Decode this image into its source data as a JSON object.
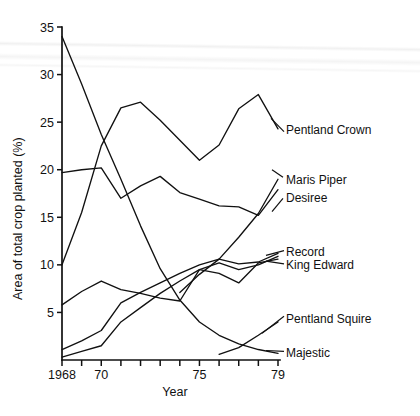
{
  "chart_data": {
    "type": "line",
    "title": "",
    "xlabel": "Year",
    "ylabel": "Area of total crop planted (%)",
    "x": [
      1968,
      1969,
      1970,
      1971,
      1972,
      1973,
      1974,
      1975,
      1976,
      1977,
      1978,
      1979
    ],
    "xlim": [
      1968,
      1979
    ],
    "ylim": [
      0,
      35
    ],
    "yticks": [
      5,
      10,
      15,
      20,
      25,
      30,
      35
    ],
    "xticks": [
      1968,
      1969,
      1970,
      1971,
      1972,
      1973,
      1974,
      1975,
      1976,
      1977,
      1978,
      1979
    ],
    "xtick_labels": [
      "1968",
      "",
      "70",
      "",
      "",
      "",
      "",
      "75",
      "",
      "",
      "",
      "79"
    ],
    "grid": false,
    "legend_position": "right-inline-labels",
    "series": [
      {
        "name": "Pentland Crown",
        "values": [
          10.0,
          15.5,
          22.5,
          26.5,
          27.1,
          25.2,
          23.1,
          21.0,
          22.6,
          26.4,
          27.9,
          24.3
        ]
      },
      {
        "name": "Maris Piper",
        "values": [
          null,
          null,
          null,
          null,
          null,
          null,
          7.1,
          9.0,
          10.6,
          12.9,
          15.4,
          19.0
        ]
      },
      {
        "name": "Desiree",
        "values": [
          19.7,
          20.0,
          20.2,
          17.0,
          18.3,
          19.3,
          17.6,
          16.9,
          16.2,
          16.1,
          15.2,
          17.9
        ]
      },
      {
        "name": "Record",
        "values": [
          1.1,
          2.0,
          3.1,
          6.0,
          7.1,
          8.1,
          9.1,
          10.0,
          10.6,
          10.1,
          10.3,
          11.2
        ]
      },
      {
        "name": "King Edward",
        "values": [
          5.8,
          7.2,
          8.3,
          7.4,
          7.0,
          6.5,
          6.2,
          9.5,
          9.1,
          8.1,
          10.2,
          10.6
        ]
      },
      {
        "name": "Pentland Squire",
        "values": [
          null,
          null,
          null,
          null,
          null,
          null,
          null,
          null,
          0.6,
          1.3,
          2.6,
          4.0
        ]
      },
      {
        "name": "Majestic",
        "values": [
          34.0,
          29.0,
          23.7,
          19.0,
          14.1,
          9.6,
          6.3,
          4.0,
          2.6,
          1.7,
          1.1,
          0.7
        ]
      },
      {
        "name": "Record (early)",
        "values": [
          0.3,
          0.9,
          1.5,
          4.0,
          5.5,
          7.0,
          8.3,
          9.5,
          10.2,
          9.5,
          10.0,
          10.9
        ]
      }
    ],
    "series_labels": [
      {
        "name": "Pentland Crown",
        "label_y": 24.2
      },
      {
        "name": "Maris Piper",
        "label_y": 19.0
      },
      {
        "name": "Desiree",
        "label_y": 17.1
      },
      {
        "name": "Record",
        "label_y": 11.4
      },
      {
        "name": "King Edward",
        "label_y": 10.0
      },
      {
        "name": "Pentland Squire",
        "label_y": 4.4
      },
      {
        "name": "Majestic",
        "label_y": 0.8
      }
    ],
    "colors": {
      "line": "#111111",
      "axis": "#111111",
      "background": "#ffffff"
    }
  }
}
